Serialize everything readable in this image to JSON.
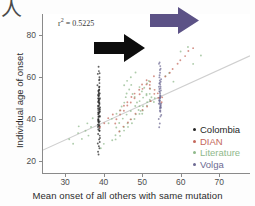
{
  "figure": {
    "crop_glyph": "人",
    "annotation": {
      "prefix": "r",
      "superscript": "2",
      "value": " = 0.5225"
    }
  },
  "axes": {
    "xlabel": "Mean onset of all others with same mutation",
    "ylabel": "Individual age of onset",
    "xticks": [
      "30",
      "40",
      "50",
      "60",
      "70"
    ],
    "yticks": [
      "20",
      "40",
      "60",
      "80"
    ]
  },
  "legend": {
    "items": [
      {
        "label": "Colombia",
        "color": "#262626"
      },
      {
        "label": "DIAN",
        "color": "#c4685c"
      },
      {
        "label": "Literature",
        "color": "#8fb98b"
      },
      {
        "label": "Volga",
        "color": "#6d6a93"
      }
    ]
  },
  "arrows": [
    {
      "name": "black-arrow",
      "color": "#0d0d0d",
      "direction": "right"
    },
    {
      "name": "purple-arrow",
      "color": "#5c5286",
      "direction": "right"
    }
  ],
  "chart_data": {
    "type": "scatter",
    "title": "",
    "xlabel": "Mean onset of all others with same mutation",
    "ylabel": "Individual age of onset",
    "xlim": [
      24,
      78
    ],
    "ylim": [
      14,
      90
    ],
    "xticks": [
      30,
      40,
      50,
      60,
      70
    ],
    "yticks": [
      20,
      40,
      60,
      80
    ],
    "grid": false,
    "legend_position": "lower-right",
    "r_squared": 0.5225,
    "trendline": {
      "x0": 24,
      "y0": 25,
      "x1": 78,
      "y1": 70,
      "color": "#cfcfcf"
    },
    "annotations": [
      {
        "text": "arrow pointing right at Colombia cluster",
        "x": 44,
        "y": 78,
        "color": "#0d0d0d"
      },
      {
        "text": "arrow pointing right at Volga cluster",
        "x": 57,
        "y": 88,
        "color": "#5c5286"
      }
    ],
    "series": [
      {
        "name": "Colombia",
        "color": "#262626",
        "x": [
          38.6,
          38.5,
          38.7,
          38.6,
          38.4,
          38.6,
          38.5,
          38.7,
          38.6,
          38.5,
          38.6,
          38.7,
          38.5,
          38.6,
          38.4,
          38.6,
          38.7,
          38.5,
          38.6,
          38.5,
          38.7,
          38.6,
          38.4,
          38.6,
          38.5,
          38.7,
          38.6,
          38.5,
          38.6,
          38.7,
          38.5,
          38.6,
          38.4,
          38.7,
          38.6,
          38.5,
          38.6,
          38.7,
          38.5,
          38.6,
          38.4,
          38.6,
          38.7,
          38.5,
          38.6,
          38.5,
          38.7,
          38.6,
          38.5,
          38.6,
          38.7,
          38.4,
          38.6,
          38.5,
          38.6,
          38.7,
          38.5,
          38.6,
          38.4,
          38.6,
          38.5,
          38.7,
          38.6,
          38.5,
          38.6,
          38.7,
          38.5,
          38.6,
          38.4,
          38.6,
          38.5,
          38.7,
          38.6,
          38.4,
          38.6,
          38.5,
          38.7,
          38.6,
          38.5,
          38.6
        ],
        "y": [
          22.5,
          24,
          25.5,
          27,
          28,
          29,
          30,
          31,
          32,
          33,
          34,
          34.5,
          35,
          35.5,
          36,
          36.5,
          37,
          37.5,
          38,
          38.5,
          39,
          39.5,
          40,
          40.5,
          41,
          41.5,
          42,
          42.5,
          43,
          43.5,
          44,
          44.5,
          45,
          45.5,
          46,
          46.5,
          47,
          47.5,
          48,
          48.5,
          49,
          49.5,
          50,
          50.5,
          51,
          51.5,
          52,
          52.5,
          53,
          54,
          55,
          56,
          57,
          58,
          59,
          60,
          61,
          62,
          63,
          65,
          40,
          41,
          42,
          43,
          44,
          45,
          46,
          47,
          48,
          49,
          50,
          38,
          39,
          37,
          36,
          51,
          52,
          53,
          54,
          55
        ]
      },
      {
        "name": "Volga",
        "color": "#6d6a93",
        "x": [
          54.5,
          54.6,
          54.4,
          54.5,
          54.7,
          54.5,
          54.6,
          54.4,
          54.5,
          54.6,
          54.5,
          54.7,
          54.4,
          54.5,
          54.6,
          54.5,
          54.4,
          54.6,
          54.5,
          54.7,
          54.5,
          54.6,
          54.4,
          54.5,
          54.6,
          54.5,
          54.7,
          54.4,
          54.5,
          54.6,
          54.5,
          54.4,
          54.6,
          54.5,
          54.7,
          54.5,
          54.6,
          54.4,
          54.5,
          54.6,
          54.5,
          54.4,
          54.6,
          54.5,
          54.7,
          54.5,
          54.6,
          54.4,
          54.5,
          54.6
        ],
        "y": [
          36,
          38,
          40,
          41,
          42,
          43,
          44,
          45,
          45.5,
          46,
          46.5,
          47,
          47.5,
          48,
          48.5,
          49,
          49.5,
          50,
          50.5,
          51,
          51.5,
          52,
          52.5,
          53,
          53.5,
          54,
          54.5,
          55,
          55.5,
          56,
          56.5,
          57,
          57.5,
          58,
          59,
          60,
          61,
          62,
          63,
          64,
          65,
          66,
          67,
          44,
          45,
          46,
          47,
          48,
          49,
          50
        ]
      },
      {
        "name": "Literature",
        "color": "#8fb98b",
        "x": [
          31,
          32,
          33,
          33.5,
          34,
          35,
          35.5,
          36,
          36.5,
          37,
          41,
          42,
          43,
          44,
          44.5,
          45,
          45.5,
          46,
          46.5,
          47,
          47.5,
          48,
          48.5,
          49,
          49.5,
          50,
          50.5,
          51,
          51.5,
          52,
          52.5,
          53,
          43,
          44,
          45,
          46,
          47,
          48,
          49,
          50,
          51,
          52,
          45,
          46,
          47,
          48,
          49,
          50,
          51,
          52,
          44,
          45,
          46,
          47,
          48,
          49,
          50,
          51,
          56,
          57,
          58,
          60,
          62,
          63,
          65,
          42,
          43,
          40,
          39,
          50,
          51,
          52,
          53,
          47,
          48,
          49,
          46,
          45,
          44,
          43
        ],
        "y": [
          30,
          28,
          33,
          36,
          30,
          34,
          38,
          32,
          36,
          40,
          38,
          40,
          42,
          44,
          46,
          48,
          50,
          52,
          54,
          56,
          52,
          50,
          48,
          46,
          44,
          42,
          55,
          57,
          58,
          52,
          50,
          48,
          36,
          38,
          40,
          42,
          44,
          46,
          48,
          50,
          52,
          54,
          56,
          58,
          60,
          62,
          55,
          53,
          51,
          49,
          34,
          36,
          38,
          40,
          42,
          44,
          46,
          48,
          60,
          62,
          58,
          72,
          74,
          66,
          70,
          30,
          32,
          28,
          26,
          44,
          46,
          48,
          50,
          38,
          40,
          42,
          36,
          34,
          32,
          30
        ]
      },
      {
        "name": "DIAN",
        "color": "#c4685c",
        "x": [
          44,
          45,
          46,
          47,
          48,
          49,
          50,
          51,
          52,
          53,
          54,
          55,
          43,
          44,
          45,
          46,
          47,
          48,
          49,
          50,
          51,
          52,
          53,
          39,
          40,
          41,
          42,
          56,
          57,
          58,
          59,
          60,
          61,
          62,
          63,
          50,
          51,
          52,
          48,
          47,
          46,
          45,
          44,
          43,
          55,
          54,
          53,
          52
        ],
        "y": [
          44,
          46,
          48,
          50,
          52,
          54,
          56,
          58,
          54,
          52,
          50,
          48,
          40,
          42,
          44,
          46,
          48,
          50,
          52,
          54,
          56,
          58,
          60,
          36,
          38,
          40,
          42,
          60,
          62,
          64,
          66,
          68,
          70,
          72,
          74,
          44,
          46,
          48,
          42,
          40,
          38,
          36,
          34,
          38,
          50,
          52,
          54,
          56
        ]
      }
    ]
  }
}
